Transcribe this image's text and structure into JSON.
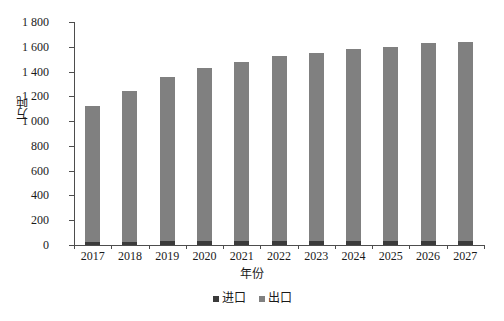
{
  "chart_data": {
    "type": "bar",
    "stacked": true,
    "title": "",
    "xlabel": "年份",
    "ylabel": "万吨",
    "categories": [
      "2017",
      "2018",
      "2019",
      "2020",
      "2021",
      "2022",
      "2023",
      "2024",
      "2025",
      "2026",
      "2027"
    ],
    "series": [
      {
        "name": "进口",
        "color": "#3b3b3b",
        "values": [
          25,
          28,
          30,
          30,
          30,
          32,
          33,
          34,
          35,
          35,
          36
        ]
      },
      {
        "name": "出口",
        "color": "#808080",
        "values": [
          1095,
          1215,
          1330,
          1400,
          1450,
          1490,
          1520,
          1545,
          1565,
          1595,
          1605
        ]
      }
    ],
    "totals": [
      1120,
      1243,
      1360,
      1430,
      1480,
      1522,
      1553,
      1579,
      1600,
      1630,
      1641
    ],
    "ylim": [
      0,
      1800
    ],
    "ytick_step": 200,
    "ytick_labels": [
      "1 800",
      "1 600",
      "1 400",
      "1 200",
      "1 000",
      "800",
      "600",
      "400",
      "200",
      "0"
    ],
    "ytick_values": [
      1800,
      1600,
      1400,
      1200,
      1000,
      800,
      600,
      400,
      200,
      0
    ],
    "grid": false,
    "legend_position": "bottom"
  },
  "axes": {
    "y_title": "万吨",
    "x_title": "年份"
  },
  "legend": {
    "items": [
      {
        "label": "进口",
        "color": "#3b3b3b"
      },
      {
        "label": "出口",
        "color": "#808080"
      }
    ]
  }
}
